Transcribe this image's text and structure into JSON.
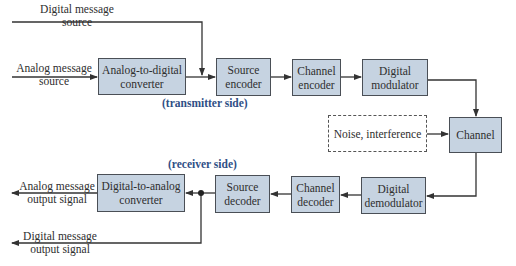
{
  "diagram": {
    "colors": {
      "box_fill": "#c6d3e1",
      "box_border": "#4a4f56",
      "side_label": "#2f4f86",
      "wire": "#333333"
    },
    "inputs": {
      "digital_source": [
        "Digital message",
        "source"
      ],
      "analog_source": [
        "Analog  message",
        "source"
      ]
    },
    "transmitter": {
      "side_label": "(transmitter side)",
      "blocks": {
        "adc": [
          "Analog-to-digital",
          "converter"
        ],
        "source_encoder": [
          "Source",
          "encoder"
        ],
        "channel_encoder": [
          "Channel",
          "encoder"
        ],
        "modulator": [
          "Digital",
          "modulator"
        ]
      }
    },
    "channel": {
      "noise": "Noise, interference",
      "channel": "Channel"
    },
    "receiver": {
      "side_label": "(receiver side)",
      "blocks": {
        "demodulator": [
          "Digital",
          "demodulator"
        ],
        "channel_decoder": [
          "Channel",
          "decoder"
        ],
        "source_decoder": [
          "Source",
          "decoder"
        ],
        "dac": [
          "Digital-to-analog",
          "converter"
        ]
      }
    },
    "outputs": {
      "analog_output": [
        "Analog  message",
        "output signal"
      ],
      "digital_output": [
        "Digital message",
        "output signal"
      ]
    }
  }
}
